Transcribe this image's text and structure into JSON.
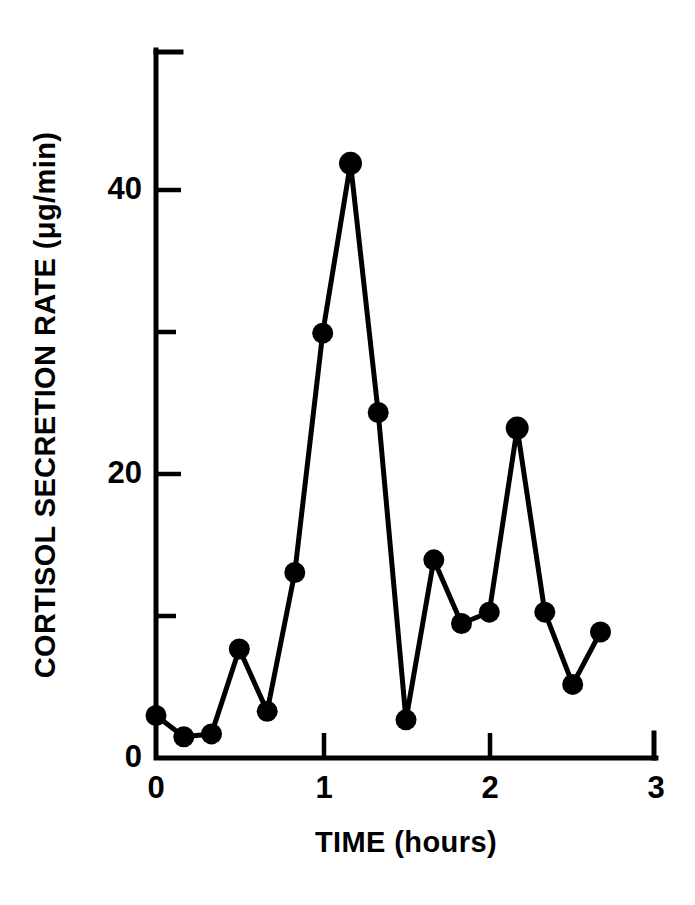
{
  "chart_data": {
    "type": "line",
    "title": "",
    "subtitle": "",
    "xlabel": "TIME (hours)",
    "ylabel": "CORTISOL SECRETION RATE (μg/min)",
    "ylabel_prefix": "CORTISOL SECRETION RATE (",
    "ylabel_unit_mu": "μ",
    "ylabel_unit_rest": "g/min)",
    "xlim": [
      0,
      3
    ],
    "ylim": [
      0,
      50
    ],
    "xticks": [
      0,
      1,
      2,
      3
    ],
    "xtick_labels": [
      "0",
      "1",
      "2",
      "3"
    ],
    "yticks": [
      0,
      20,
      40
    ],
    "ytick_labels": [
      "0",
      "20",
      "40"
    ],
    "yminor_ticks": [
      10,
      30
    ],
    "grid": false,
    "legend": null,
    "marker": "filled-circle",
    "line_color": "#000000",
    "marker_color": "#000000",
    "x": [
      0,
      0.167,
      0.333,
      0.5,
      0.667,
      0.833,
      1.0,
      1.167,
      1.333,
      1.5,
      1.667,
      1.833,
      2.0,
      2.167,
      2.333,
      2.5,
      2.667
    ],
    "values": [
      3.0,
      1.5,
      1.7,
      7.7,
      3.3,
      13.1,
      30.0,
      42.0,
      24.4,
      2.7,
      14.0,
      9.5,
      10.3,
      23.3,
      10.3,
      5.2,
      8.9
    ],
    "series": [
      {
        "name": "Cortisol secretion rate",
        "values": [
          3.0,
          1.5,
          1.7,
          7.7,
          3.3,
          13.1,
          30.0,
          42.0,
          24.4,
          2.7,
          14.0,
          9.5,
          10.3,
          23.3,
          10.3,
          5.2,
          8.9
        ]
      }
    ],
    "annotations": []
  },
  "axes": {
    "x_axis_name": "time-axis",
    "y_axis_name": "cortisol-axis"
  }
}
